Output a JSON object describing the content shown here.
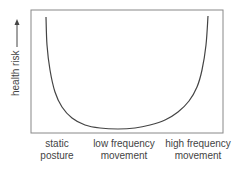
{
  "chart_data": {
    "type": "line",
    "title": "",
    "xlabel": "",
    "ylabel": "health risk",
    "ylabel_arrow": "up",
    "x_categories": [
      {
        "line1": "static",
        "line2": "posture"
      },
      {
        "line1": "low frequency",
        "line2": "movement"
      },
      {
        "line1": "high frequency",
        "line2": "movement"
      }
    ],
    "series": [
      {
        "name": "health risk curve",
        "shape": "U-shaped",
        "points_px": [
          [
            46,
            17
          ],
          [
            47,
            45
          ],
          [
            50,
            70
          ],
          [
            55,
            92
          ],
          [
            62,
            107
          ],
          [
            72,
            118
          ],
          [
            85,
            125
          ],
          [
            100,
            128
          ],
          [
            118,
            129
          ],
          [
            135,
            128
          ],
          [
            150,
            125
          ],
          [
            165,
            120
          ],
          [
            178,
            112
          ],
          [
            189,
            101
          ],
          [
            197,
            87
          ],
          [
            202,
            70
          ],
          [
            206,
            45
          ],
          [
            208,
            16
          ]
        ]
      }
    ],
    "grid": false,
    "legend": null
  },
  "colors": {
    "frame": "#777777",
    "curve": "#444444",
    "text": "#444444"
  }
}
